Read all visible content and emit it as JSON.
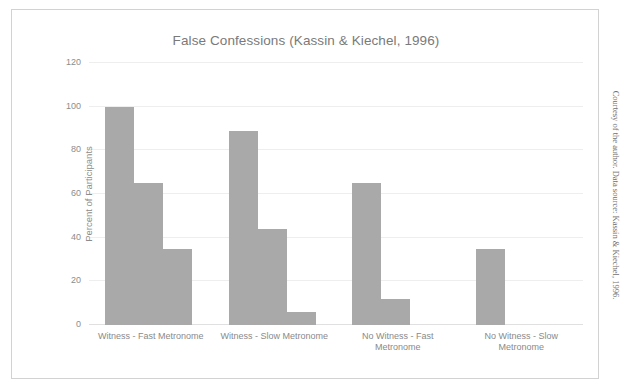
{
  "figure": {
    "title": "False Confessions (Kassin & Kiechel, 1996)",
    "credit": "Courtesy of the author. Data source: Kassin & Kiechel, 1996."
  },
  "chart_data": {
    "type": "bar",
    "title": "False Confessions (Kassin & Kiechel, 1996)",
    "xlabel": "",
    "ylabel": "Percent of Participants",
    "ylim": [
      0,
      120
    ],
    "yticks": [
      0,
      20,
      40,
      60,
      80,
      100,
      120
    ],
    "ytick_labels": [
      "0",
      "20",
      "40",
      "60",
      "80",
      "100",
      "120"
    ],
    "grid": true,
    "legend": "none",
    "bar_color": "#a9a9a9",
    "categories": [
      "Witness - Fast Metronome",
      "Witness - Slow Metronome",
      "No Witness - Fast Metronome",
      "No Witness - Slow Metronome"
    ],
    "category_lines": [
      [
        "Witness - Fast Metronome"
      ],
      [
        "Witness - Slow Metronome"
      ],
      [
        "No Witness - Fast",
        "Metronome"
      ],
      [
        "No Witness - Slow",
        "Metronome"
      ]
    ],
    "series": [
      {
        "name": "Compliance",
        "values": [
          100,
          89,
          65,
          35
        ]
      },
      {
        "name": "Internalization",
        "values": [
          65,
          44,
          12,
          null
        ]
      },
      {
        "name": "Confabulation",
        "values": [
          35,
          6,
          null,
          null
        ]
      }
    ],
    "groups": [
      {
        "category": "Witness - Fast Metronome",
        "values": [
          100,
          65,
          35
        ]
      },
      {
        "category": "Witness - Slow Metronome",
        "values": [
          89,
          44,
          6
        ]
      },
      {
        "category": "No Witness - Fast Metronome",
        "values": [
          65,
          12
        ]
      },
      {
        "category": "No Witness - Slow Metronome",
        "values": [
          35
        ]
      }
    ]
  }
}
